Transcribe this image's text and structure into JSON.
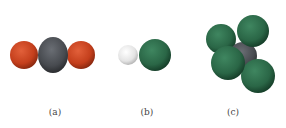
{
  "figure": {
    "panels": [
      {
        "id": "a",
        "label": "(a)",
        "label_x": 55,
        "molecule": "CO2"
      },
      {
        "id": "b",
        "label": "(b)",
        "label_x": 147,
        "molecule": "HCl"
      },
      {
        "id": "c",
        "label": "(c)",
        "label_x": 233,
        "molecule": "CCl4"
      }
    ],
    "colors": {
      "oxygen": "#c7421f",
      "carbon": "#4a4d52",
      "hydrogen": "#e6e6e6",
      "chlorine": "#2e6b4a"
    }
  }
}
